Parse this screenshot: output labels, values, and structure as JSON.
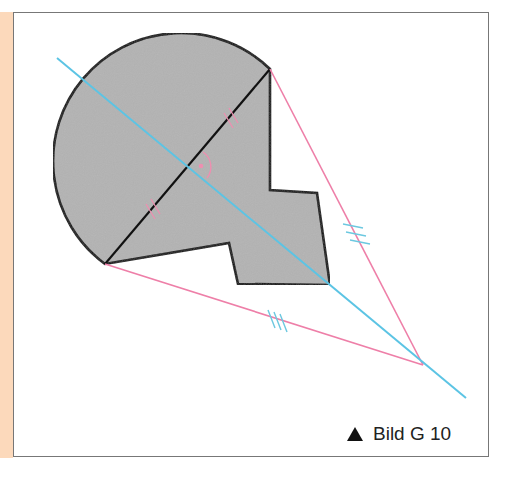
{
  "figure": {
    "caption_label": "Bild G 10",
    "caption_icon": "triangle-marker-icon",
    "colors": {
      "side_strip": "#fcd9bb",
      "shape_fill": "#b3b3b3",
      "outline": "#111111",
      "symmetry_axis": "#5cc4e4",
      "construction_lines": "#ee7fa8",
      "tick_marks_pink": "#ee8fb0",
      "tick_marks_cyan": "#6cc8e0",
      "frame_border": "#777777"
    },
    "elements": {
      "shape": "gray region bounded by a circular arc and a polygon with a notch",
      "chord": "black segment between the two arc endpoints, bisected (equal-length marks)",
      "axis": "cyan perpendicular bisector line",
      "right_angle_marker": "arc with dot at intersection",
      "pink_segments": "two equal segments (triple-tick marks) from chord endpoints to a point on the axis"
    }
  }
}
